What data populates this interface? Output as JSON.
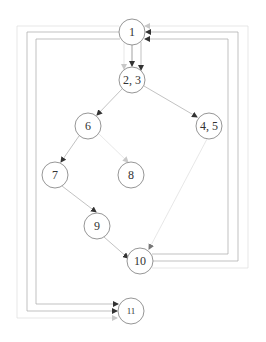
{
  "diagram": {
    "type": "control-flow-graph",
    "nodes": [
      {
        "id": "n1",
        "label": "1",
        "x": 132,
        "y": 32
      },
      {
        "id": "n23",
        "label": "2, 3",
        "x": 132,
        "y": 80
      },
      {
        "id": "n6",
        "label": "6",
        "x": 88,
        "y": 126
      },
      {
        "id": "n45",
        "label": "4, 5",
        "x": 209,
        "y": 126
      },
      {
        "id": "n7",
        "label": "7",
        "x": 55,
        "y": 175
      },
      {
        "id": "n8",
        "label": "8",
        "x": 131,
        "y": 175
      },
      {
        "id": "n9",
        "label": "9",
        "x": 97,
        "y": 226
      },
      {
        "id": "n10",
        "label": "10",
        "x": 140,
        "y": 261
      },
      {
        "id": "n11",
        "label": "11",
        "x": 131,
        "y": 311
      }
    ],
    "edges": [
      {
        "from": "1",
        "to": "2, 3"
      },
      {
        "from": "1",
        "to": "2, 3"
      },
      {
        "from": "2, 3",
        "to": "6"
      },
      {
        "from": "2, 3",
        "to": "4, 5"
      },
      {
        "from": "6",
        "to": "7"
      },
      {
        "from": "6",
        "to": "8"
      },
      {
        "from": "7",
        "to": "9"
      },
      {
        "from": "9",
        "to": "10"
      },
      {
        "from": "4, 5",
        "to": "10"
      },
      {
        "from": "10",
        "to": "1"
      },
      {
        "from": "10",
        "to": "1"
      },
      {
        "from": "10",
        "to": "1"
      },
      {
        "from": "1",
        "to": "11"
      },
      {
        "from": "1",
        "to": "11"
      },
      {
        "from": "1",
        "to": "11"
      }
    ]
  },
  "labels": {
    "n1": "1",
    "n23": "2, 3",
    "n6": "6",
    "n45": "4, 5",
    "n7": "7",
    "n8": "8",
    "n9": "9",
    "n10": "10",
    "n11": "11"
  },
  "colors": {
    "node_stroke": "#8a8a8a",
    "edge_dark": "#7a7a7a",
    "edge_mid": "#a8a8a8",
    "edge_light": "#dcdcdc",
    "background": "#ffffff"
  }
}
